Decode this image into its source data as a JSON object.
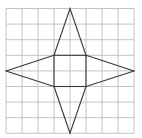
{
  "diagram": {
    "type": "star-net-on-grid",
    "grid": {
      "columns": 8,
      "rows": 8
    },
    "colors": {
      "grid": "#c4c4c4",
      "shape": "#3a3a3a",
      "background": "#ffffff"
    },
    "square": {
      "from": [
        3,
        3
      ],
      "to": [
        5,
        5
      ]
    },
    "triangles": [
      {
        "name": "top",
        "base": [
          [
            3,
            3
          ],
          [
            5,
            3
          ]
        ],
        "apex": [
          4,
          0
        ]
      },
      {
        "name": "bottom",
        "base": [
          [
            3,
            5
          ],
          [
            5,
            5
          ]
        ],
        "apex": [
          4,
          8
        ]
      },
      {
        "name": "left",
        "base": [
          [
            3,
            3
          ],
          [
            3,
            5
          ]
        ],
        "apex": [
          0,
          4
        ]
      },
      {
        "name": "right",
        "base": [
          [
            5,
            3
          ],
          [
            5,
            5
          ]
        ],
        "apex": [
          8,
          4
        ]
      }
    ]
  }
}
